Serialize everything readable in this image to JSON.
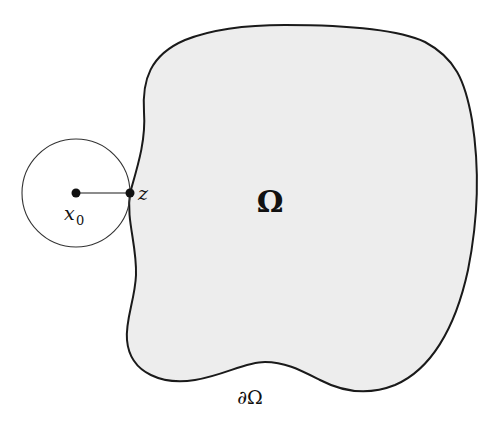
{
  "diagram": {
    "type": "domain-with-exterior-ball",
    "labels": {
      "domain": "Ω",
      "boundary": "∂Ω",
      "center_var": "x",
      "center_sub": "0",
      "contact_point": "z"
    },
    "colors": {
      "background": "#ffffff",
      "domain_fill": "#ededed",
      "stroke": "#1a1a1a",
      "circle_stroke": "#333333"
    },
    "elements": [
      {
        "name": "domain-region",
        "label": "Ω"
      },
      {
        "name": "boundary-curve",
        "label": "∂Ω"
      },
      {
        "name": "exterior-ball",
        "center": "x0",
        "touches_boundary_at": "z"
      },
      {
        "name": "radius-segment",
        "from": "x0",
        "to": "z"
      }
    ]
  }
}
